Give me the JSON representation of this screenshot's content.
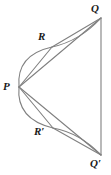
{
  "figure": {
    "name": "geometry-diagram",
    "stroke_color": "#808080",
    "label_color": "#1a1a1a",
    "background_color": "#ffffff",
    "labels": {
      "P": "P",
      "Q": "Q",
      "Q_prime": "Q′",
      "R": "R",
      "R_prime": "R′"
    },
    "points": {
      "P": {
        "x": 19,
        "y": 87
      },
      "Q": {
        "x": 101,
        "y": 18
      },
      "Q_prime": {
        "x": 101,
        "y": 155
      },
      "R": {
        "x": 52,
        "y": 47
      },
      "R_prime": {
        "x": 53,
        "y": 128
      }
    },
    "segments": [
      {
        "name": "segment-QQprime",
        "from": "Q",
        "to": "Q_prime"
      },
      {
        "name": "segment-PQ",
        "from": "P",
        "to": "Q"
      },
      {
        "name": "segment-PQprime",
        "from": "P",
        "to": "Q_prime"
      },
      {
        "name": "segment-PR",
        "from": "P",
        "to": "R"
      },
      {
        "name": "segment-PRprime",
        "from": "P",
        "to": "R_prime"
      },
      {
        "name": "segment-RQ",
        "from": "R",
        "to": "Q"
      },
      {
        "name": "segment-RprimeQprime",
        "from": "R_prime",
        "to": "Q_prime"
      }
    ],
    "arcs": [
      {
        "name": "arc-P-R-Q",
        "from": "P",
        "through": "R",
        "to": "Q"
      },
      {
        "name": "arc-P-Rprime-Qprime",
        "from": "P",
        "through": "R_prime",
        "to": "Q_prime"
      }
    ]
  }
}
